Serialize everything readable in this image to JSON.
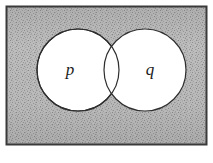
{
  "figure": {
    "type": "venn-diagram",
    "universe": {
      "name": "universal-set-rectangle",
      "label": "",
      "fill": "#b9b9b9",
      "border_color": "#3a3a3a",
      "shading": "stipple",
      "x": 6,
      "y": 6,
      "width": 201,
      "height": 139
    },
    "sets": [
      {
        "id": "p",
        "label": "p",
        "fill": "#ffffff",
        "stroke": "#2e2e2e",
        "cx": 78,
        "cy": 70,
        "r": 41,
        "label_x": 70,
        "label_y": 71
      },
      {
        "id": "q",
        "label": "q",
        "fill": "#ffffff",
        "stroke": "#2e2e2e",
        "cx": 145,
        "cy": 70,
        "r": 41,
        "label_x": 150,
        "label_y": 71
      }
    ],
    "intersection": {
      "name": "intersection-lens",
      "fill": "#ffffff",
      "shaded": false
    }
  },
  "colors": {
    "background": "#ffffff",
    "shade": "#b9b9b9",
    "shade_dark": "#9e9e9e",
    "outline": "#2e2e2e",
    "border": "#3a3a3a",
    "label": "#1a1a1a"
  }
}
